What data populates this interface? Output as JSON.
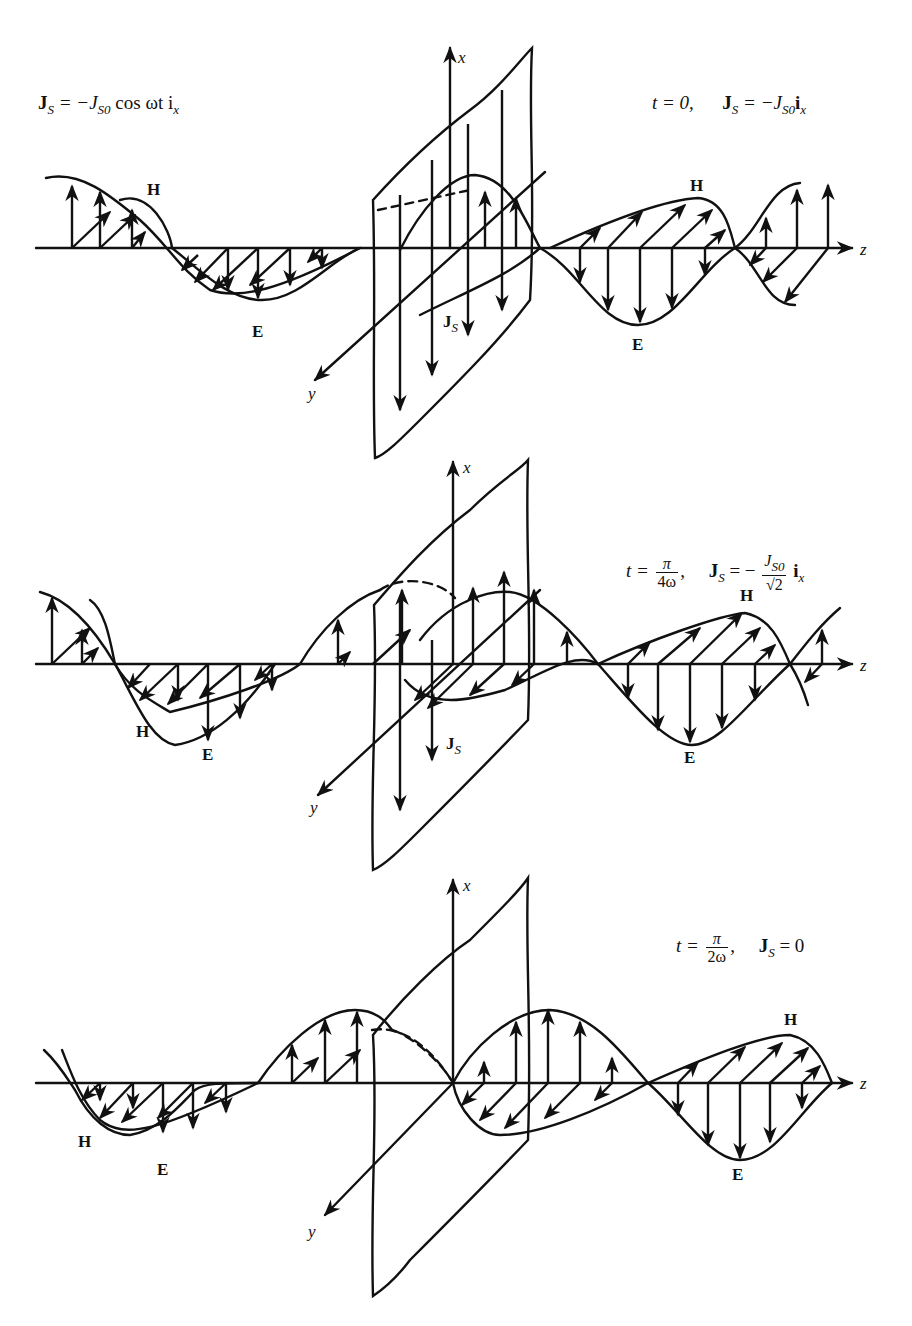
{
  "figure": {
    "global_equation": {
      "lhs": "J",
      "lhs_sub": "S",
      "rhs_prefix": "= −J",
      "rhs_sub": "S0",
      "rhs_suffix": " cos ωt i",
      "rhs_vec_sub": "x"
    },
    "panels": [
      {
        "id": "t0",
        "time_label": "t = 0,",
        "current_label": "J",
        "current_sub": "S",
        "current_eq": "= −J",
        "current_eq_sub": "S0",
        "current_eq_vec": "i",
        "current_eq_vec_sub": "x",
        "axes": {
          "x": "x",
          "y": "y",
          "z": "z"
        },
        "field_labels": {
          "H_left": "H",
          "E_left": "E",
          "H_right": "H",
          "E_right": "E",
          "Js": "J",
          "Js_sub": "S"
        }
      },
      {
        "id": "t_pi_4w",
        "time_prefix": "t =",
        "time_num": "π",
        "time_den": "4ω",
        "current_label": "J",
        "current_sub": "S",
        "current_eq": "= −",
        "frac_num": "J",
        "frac_num_sub": "S0",
        "frac_den": "√2",
        "current_eq_vec": "i",
        "current_eq_vec_sub": "x",
        "axes": {
          "x": "x",
          "y": "y",
          "z": "z"
        },
        "field_labels": {
          "H_left": "H",
          "E_left": "E",
          "H_right": "H",
          "E_right": "E",
          "Js": "J",
          "Js_sub": "S"
        }
      },
      {
        "id": "t_pi_2w",
        "time_prefix": "t =",
        "time_num": "π",
        "time_den": "2ω",
        "current_label": "J",
        "current_sub": "S",
        "current_eq": "= 0",
        "axes": {
          "x": "x",
          "y": "y",
          "z": "z"
        },
        "field_labels": {
          "H_left": "H",
          "E_left": "E",
          "H_right": "H",
          "E_right": "E"
        }
      }
    ]
  }
}
